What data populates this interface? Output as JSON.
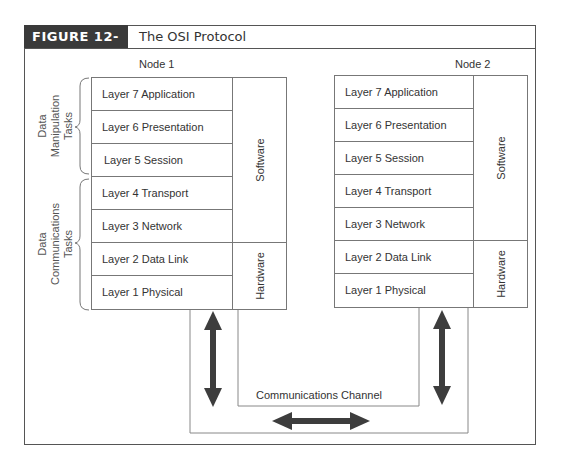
{
  "figure": {
    "number_label": "FIGURE 12-23",
    "title": "The OSI Protocol"
  },
  "node1": {
    "title": "Node 1",
    "layers": [
      "Layer 7 Application",
      "Layer 6 Presentation",
      "Layer 5 Session",
      "Layer 4 Transport",
      "Layer 3 Network",
      "Layer 2 Data Link",
      "Layer 1 Physical"
    ],
    "software_label": "Software",
    "hardware_label": "Hardware"
  },
  "node2": {
    "title": "Node 2",
    "layers": [
      "Layer 7 Application",
      "Layer 6 Presentation",
      "Layer 5 Session",
      "Layer 4 Transport",
      "Layer 3 Network",
      "Layer 2 Data Link",
      "Layer 1 Physical"
    ],
    "software_label": "Software",
    "hardware_label": "Hardware"
  },
  "groups": {
    "manipulation": "Data\nManipulation\nTasks",
    "communications": "Data\nCommunications\nTasks"
  },
  "channel": {
    "label": "Communications Channel"
  },
  "colors": {
    "header_bg": "#3a3a3a",
    "arrow": "#3d3d3d",
    "line": "#777777"
  }
}
